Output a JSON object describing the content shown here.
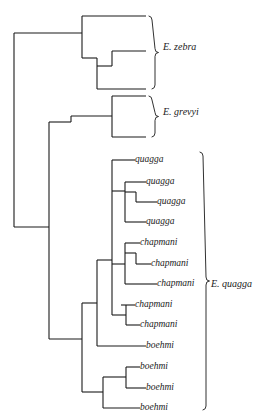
{
  "figure": {
    "type": "phylogenetic-tree",
    "orientation": "left-to-right",
    "background_color": "#ffffff",
    "line_color": "#1a1a1a",
    "text_color": "#1a1a1a",
    "width": 261,
    "height": 414
  },
  "clades": [
    {
      "name": "E. zebra",
      "label": "E. zebra",
      "tip_count": 4,
      "bracket": {
        "x": 152,
        "y_top": 16,
        "y_bottom": 89,
        "label_x": 163,
        "label_y": 47
      }
    },
    {
      "name": "E. grevyi",
      "label": "E. grevyi",
      "tip_count": 2,
      "bracket": {
        "x": 152,
        "y_top": 96,
        "y_bottom": 137,
        "label_x": 163,
        "label_y": 112
      }
    },
    {
      "name": "E. quagga",
      "label": "E. quagga",
      "tip_count": 13,
      "bracket": {
        "x": 203,
        "y_top": 152,
        "y_bottom": 410,
        "label_x": 211,
        "label_y": 284
      }
    }
  ],
  "tips": [
    {
      "id": "zebra-1",
      "label": "",
      "x": 146,
      "y": 16
    },
    {
      "id": "zebra-2",
      "label": "",
      "x": 146,
      "y": 51
    },
    {
      "id": "zebra-3",
      "label": "",
      "x": 146,
      "y": 66
    },
    {
      "id": "zebra-4",
      "label": "",
      "x": 146,
      "y": 89
    },
    {
      "id": "grevyi-1",
      "label": "",
      "x": 146,
      "y": 96
    },
    {
      "id": "grevyi-2",
      "label": "",
      "x": 146,
      "y": 137
    },
    {
      "id": "quagga-1",
      "label": "quagga",
      "x": 135,
      "y": 160
    },
    {
      "id": "quagga-2",
      "label": "quagga",
      "x": 146,
      "y": 182
    },
    {
      "id": "quagga-3",
      "label": "quagga",
      "x": 157,
      "y": 202
    },
    {
      "id": "quagga-4",
      "label": "quagga",
      "x": 146,
      "y": 222
    },
    {
      "id": "chapmani-1",
      "label": "chapmani",
      "x": 140,
      "y": 243
    },
    {
      "id": "chapmani-2",
      "label": "chapmani",
      "x": 151,
      "y": 264
    },
    {
      "id": "chapmani-3",
      "label": "chapmani",
      "x": 157,
      "y": 284
    },
    {
      "id": "chapmani-4",
      "label": "chapmani",
      "x": 135,
      "y": 305
    },
    {
      "id": "chapmani-5",
      "label": "chapmani",
      "x": 140,
      "y": 325
    },
    {
      "id": "boehmi-1",
      "label": "boehmi",
      "x": 146,
      "y": 346
    },
    {
      "id": "boehmi-2",
      "label": "boehmi",
      "x": 140,
      "y": 367
    },
    {
      "id": "boehmi-3",
      "label": "boehmi",
      "x": 146,
      "y": 388
    },
    {
      "id": "boehmi-4",
      "label": "boehmi",
      "x": 140,
      "y": 408
    }
  ],
  "branches": {
    "description": "Rectangular cladogram segments drawn as horizontal and vertical line pairs",
    "horizontal": [
      {
        "y": 16,
        "x1": 82,
        "x2": 146
      },
      {
        "y": 51,
        "x1": 112,
        "x2": 146
      },
      {
        "y": 66,
        "x1": 97,
        "x2": 112
      },
      {
        "y": 89,
        "x1": 97,
        "x2": 146
      },
      {
        "y": 33,
        "x1": 14,
        "x2": 82
      },
      {
        "y": 58,
        "x1": 82,
        "x2": 97
      },
      {
        "y": 96,
        "x1": 112,
        "x2": 146
      },
      {
        "y": 137,
        "x1": 112,
        "x2": 146
      },
      {
        "y": 116,
        "x1": 71,
        "x2": 112
      },
      {
        "y": 122,
        "x1": 49,
        "x2": 71
      },
      {
        "y": 227,
        "x1": 14,
        "x2": 49
      },
      {
        "y": 160,
        "x1": 112,
        "x2": 135
      },
      {
        "y": 182,
        "x1": 125,
        "x2": 146
      },
      {
        "y": 202,
        "x1": 136,
        "x2": 157
      },
      {
        "y": 222,
        "x1": 125,
        "x2": 146
      },
      {
        "y": 192,
        "x1": 125,
        "x2": 136
      },
      {
        "y": 191,
        "x1": 112,
        "x2": 125
      },
      {
        "y": 243,
        "x1": 125,
        "x2": 140
      },
      {
        "y": 264,
        "x1": 136,
        "x2": 151
      },
      {
        "y": 284,
        "x1": 125,
        "x2": 157
      },
      {
        "y": 253,
        "x1": 125,
        "x2": 136
      },
      {
        "y": 264,
        "x1": 112,
        "x2": 125
      },
      {
        "y": 305,
        "x1": 121,
        "x2": 135
      },
      {
        "y": 325,
        "x1": 126,
        "x2": 140
      },
      {
        "y": 315,
        "x1": 112,
        "x2": 126
      },
      {
        "y": 346,
        "x1": 97,
        "x2": 146
      },
      {
        "y": 260,
        "x1": 97,
        "x2": 112
      },
      {
        "y": 303,
        "x1": 82,
        "x2": 97
      },
      {
        "y": 367,
        "x1": 126,
        "x2": 140
      },
      {
        "y": 388,
        "x1": 126,
        "x2": 146
      },
      {
        "y": 377,
        "x1": 103,
        "x2": 126
      },
      {
        "y": 408,
        "x1": 103,
        "x2": 140
      },
      {
        "y": 392,
        "x1": 82,
        "x2": 103
      },
      {
        "y": 339,
        "x1": 49,
        "x2": 82
      }
    ],
    "vertical": [
      {
        "x": 14,
        "y1": 33,
        "y2": 227
      },
      {
        "x": 82,
        "y1": 16,
        "y2": 58
      },
      {
        "x": 97,
        "y1": 58,
        "y2": 89
      },
      {
        "x": 112,
        "y1": 51,
        "y2": 66
      },
      {
        "x": 112,
        "y1": 96,
        "y2": 137
      },
      {
        "x": 71,
        "y1": 116,
        "y2": 122
      },
      {
        "x": 49,
        "y1": 122,
        "y2": 339
      },
      {
        "x": 112,
        "y1": 160,
        "y2": 191
      },
      {
        "x": 125,
        "y1": 182,
        "y2": 222
      },
      {
        "x": 136,
        "y1": 192,
        "y2": 202
      },
      {
        "x": 125,
        "y1": 243,
        "y2": 284
      },
      {
        "x": 136,
        "y1": 253,
        "y2": 264
      },
      {
        "x": 112,
        "y1": 191,
        "y2": 264
      },
      {
        "x": 126,
        "y1": 305,
        "y2": 325
      },
      {
        "x": 112,
        "y1": 264,
        "y2": 315
      },
      {
        "x": 97,
        "y1": 260,
        "y2": 346
      },
      {
        "x": 82,
        "y1": 303,
        "y2": 392
      },
      {
        "x": 126,
        "y1": 367,
        "y2": 388
      },
      {
        "x": 103,
        "y1": 377,
        "y2": 408
      }
    ]
  }
}
